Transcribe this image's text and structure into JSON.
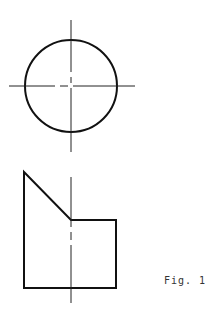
{
  "figure": {
    "caption": "Fig. 1",
    "line_color": "#111111",
    "centerline_color": "#222222",
    "top_view": {
      "shape": "circle",
      "center": [
        71,
        86
      ],
      "radius": 46,
      "centerlines": {
        "vertical": [
          71,
          20,
          71,
          152
        ],
        "horizontal": [
          9,
          86,
          135,
          86
        ]
      }
    },
    "front_view": {
      "shape": "stepped-polygon",
      "points": [
        [
          24,
          172
        ],
        [
          71,
          220
        ],
        [
          116,
          220
        ],
        [
          116,
          288
        ],
        [
          24,
          288
        ]
      ],
      "centerline": [
        71,
        177,
        71,
        303
      ]
    }
  }
}
